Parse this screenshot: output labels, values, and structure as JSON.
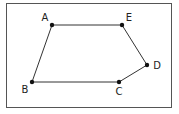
{
  "diagram": {
    "type": "polygon",
    "frame": {
      "x": 6,
      "y": 3,
      "width": 166,
      "height": 105,
      "color": "#555555"
    },
    "stroke_color": "#333333",
    "vertices": [
      {
        "id": "A",
        "label": "A",
        "x": 52,
        "y": 25,
        "label_x": 45,
        "label_y": 18
      },
      {
        "id": "E",
        "label": "E",
        "x": 122,
        "y": 25,
        "label_x": 129,
        "label_y": 18
      },
      {
        "id": "D",
        "label": "D",
        "x": 147,
        "y": 65,
        "label_x": 157,
        "label_y": 66
      },
      {
        "id": "C",
        "label": "C",
        "x": 119,
        "y": 82,
        "label_x": 119,
        "label_y": 92
      },
      {
        "id": "B",
        "label": "B",
        "x": 32,
        "y": 82,
        "label_x": 25,
        "label_y": 90
      }
    ],
    "edges": [
      [
        "A",
        "E"
      ],
      [
        "E",
        "D"
      ],
      [
        "D",
        "C"
      ],
      [
        "C",
        "B"
      ],
      [
        "B",
        "A"
      ]
    ],
    "labels": {
      "A": "A",
      "B": "B",
      "C": "C",
      "D": "D",
      "E": "E"
    }
  }
}
